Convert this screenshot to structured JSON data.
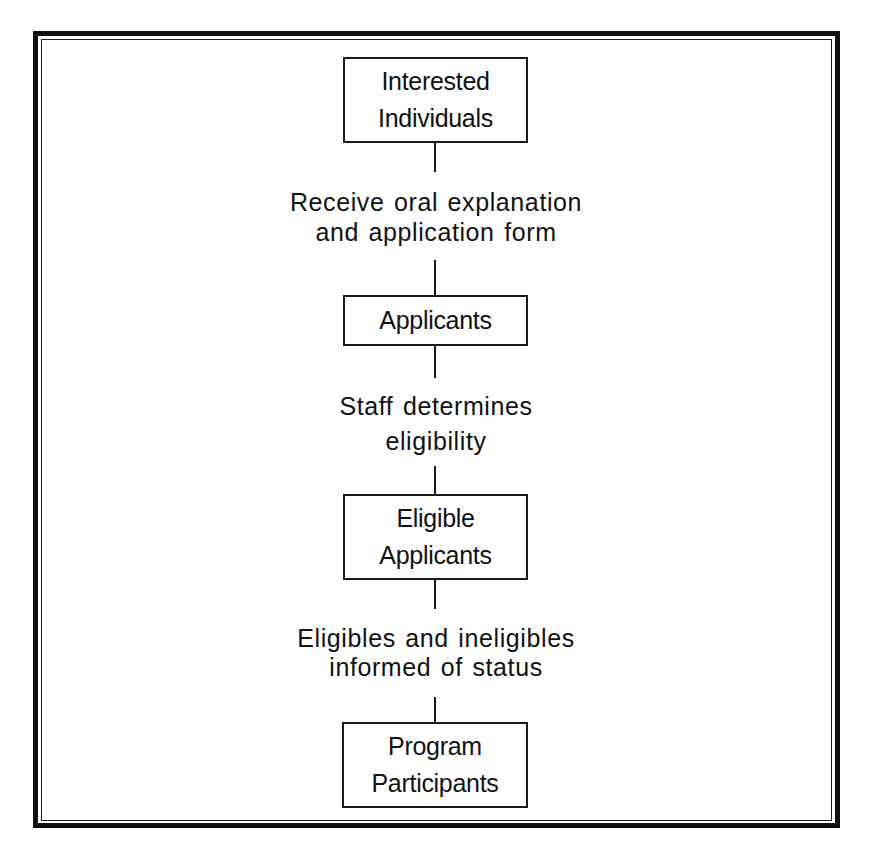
{
  "diagram": {
    "type": "flowchart",
    "direction": "top-to-bottom",
    "nodes": [
      {
        "id": "interested",
        "lines": [
          "Interested",
          "Individuals"
        ]
      },
      {
        "id": "applicants",
        "lines": [
          "Applicants"
        ]
      },
      {
        "id": "eligible",
        "lines": [
          "Eligible",
          "Applicants"
        ]
      },
      {
        "id": "participants",
        "lines": [
          "Program",
          "Participants"
        ]
      }
    ],
    "edges": [
      {
        "from": "interested",
        "to": "applicants",
        "lines": [
          "Receive oral explanation",
          "and application form"
        ]
      },
      {
        "from": "applicants",
        "to": "eligible",
        "lines": [
          "Staff determines",
          "eligibility"
        ]
      },
      {
        "from": "eligible",
        "to": "participants",
        "lines": [
          "Eligibles and ineligibles",
          "informed of status"
        ]
      }
    ]
  },
  "colors": {
    "line": "#111111",
    "background": "#ffffff"
  }
}
